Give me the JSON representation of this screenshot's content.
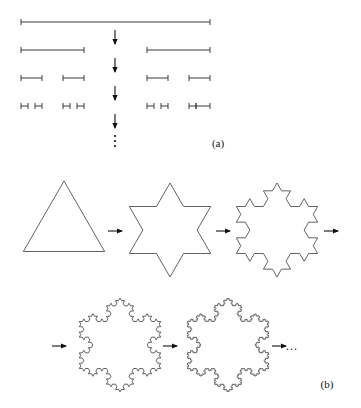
{
  "figure": {
    "title_visible": false,
    "background_color": "#ffffff",
    "stroke_color": "#3a3a3a",
    "arrow_color": "#111111",
    "panels": [
      {
        "id": "panel-a",
        "label": "(a)",
        "label_x": 218,
        "label_y": 147,
        "construction": "cantor-set",
        "rows": [
          {
            "index": 0,
            "y": 22,
            "segments": [
              [
                21,
                210
              ]
            ]
          },
          {
            "index": 1,
            "y": 50,
            "segments": [
              [
                21,
                84
              ],
              [
                147,
                210
              ]
            ]
          },
          {
            "index": 2,
            "y": 78,
            "segments": [
              [
                21,
                42
              ],
              [
                63,
                84
              ],
              [
                147,
                168
              ],
              [
                189,
                210
              ]
            ]
          },
          {
            "index": 3,
            "y": 106,
            "segments": [
              [
                21,
                28
              ],
              [
                35,
                42
              ],
              [
                63,
                70
              ],
              [
                77,
                84
              ],
              [
                147,
                154
              ],
              [
                161,
                168
              ],
              [
                189,
                196
              ],
              [
                196,
                210
              ]
            ]
          }
        ],
        "tick_half_height": 3,
        "arrows": [
          {
            "x": 115,
            "y_from": 30,
            "y_to": 44
          },
          {
            "x": 115,
            "y_from": 58,
            "y_to": 72
          },
          {
            "x": 115,
            "y_from": 86,
            "y_to": 100
          },
          {
            "x": 115,
            "y_from": 114,
            "y_to": 128
          }
        ],
        "vertical_ellipsis": {
          "x": 115,
          "y_start": 136,
          "dot_count": 3,
          "dot_spacing": 5,
          "dot_radius": 1.1
        }
      },
      {
        "id": "panel-b",
        "label": "(b)",
        "label_x": 327,
        "label_y": 388,
        "construction": "koch-snowflake",
        "shapes": [
          {
            "iteration": 0,
            "name": "triangle",
            "cx": 64,
            "cy": 228,
            "radius": 47
          },
          {
            "iteration": 1,
            "name": "star-of-david",
            "cx": 170,
            "cy": 230,
            "radius": 47
          },
          {
            "iteration": 2,
            "name": "koch-2",
            "cx": 277,
            "cy": 230,
            "radius": 47
          },
          {
            "iteration": 3,
            "name": "koch-3",
            "cx": 120,
            "cy": 345,
            "radius": 47
          },
          {
            "iteration": 4,
            "name": "koch-4",
            "cx": 228,
            "cy": 345,
            "radius": 47
          }
        ],
        "arrows": [
          {
            "x_from": 108,
            "x_to": 122,
            "y": 231
          },
          {
            "x_from": 216,
            "x_to": 230,
            "y": 231
          },
          {
            "x_from": 324,
            "x_to": 338,
            "y": 231
          },
          {
            "x_from": 52,
            "x_to": 66,
            "y": 346
          },
          {
            "x_from": 163,
            "x_to": 177,
            "y": 346
          },
          {
            "x_from": 272,
            "x_to": 286,
            "y": 346
          }
        ],
        "trailing_ellipsis": {
          "text": "...",
          "x": 292,
          "y": 350
        }
      }
    ]
  }
}
